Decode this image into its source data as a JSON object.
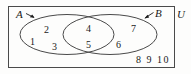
{
  "figure": {
    "type": "venn-diagram",
    "universe_label": "U",
    "sets": [
      {
        "id": "A",
        "label": "A",
        "label_x": 16,
        "label_y": 10,
        "pointer": "arrow-down-right"
      },
      {
        "id": "B",
        "label": "B",
        "label_x": 155,
        "label_y": 9,
        "pointer": "arrow-up-right"
      }
    ],
    "regions": [
      {
        "name": "A-only",
        "elements": [
          {
            "value": "1",
            "x": 30,
            "y": 37
          },
          {
            "value": "2",
            "x": 44,
            "y": 25
          },
          {
            "value": "3",
            "x": 52,
            "y": 42
          }
        ]
      },
      {
        "name": "A-intersect-B",
        "elements": [
          {
            "value": "4",
            "x": 86,
            "y": 24
          },
          {
            "value": "5",
            "x": 86,
            "y": 40
          }
        ]
      },
      {
        "name": "B-only",
        "elements": [
          {
            "value": "6",
            "x": 116,
            "y": 40
          },
          {
            "value": "7",
            "x": 131,
            "y": 24
          }
        ]
      },
      {
        "name": "outside-A-and-B",
        "elements": [
          {
            "value": "8",
            "x": 137,
            "y": 56
          },
          {
            "value": "9",
            "x": 149,
            "y": 56
          },
          {
            "value": "10",
            "x": 158,
            "y": 56
          }
        ]
      }
    ],
    "outside_text": "8  9  10",
    "colors": {
      "stroke": "#4a4a4a",
      "text": "#1a1a1a",
      "background": "#fdfdfc"
    }
  }
}
